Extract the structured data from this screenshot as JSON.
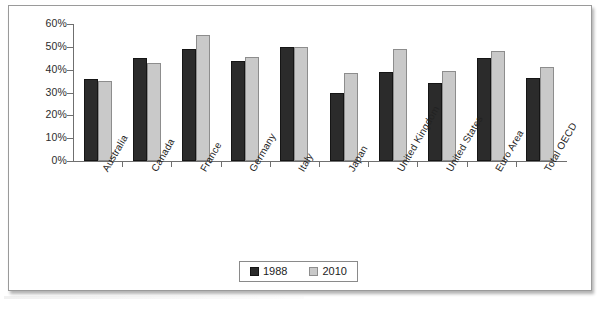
{
  "chart_data": {
    "type": "bar",
    "title": "",
    "xlabel": "",
    "ylabel": "",
    "ylim": [
      0,
      60
    ],
    "ytick_labels": [
      "60%",
      "50%",
      "40%",
      "30%",
      "20%",
      "10%",
      "0%"
    ],
    "ytick_values": [
      60,
      50,
      40,
      30,
      20,
      10,
      0
    ],
    "grid": false,
    "legend_position": "bottom-center",
    "categories": [
      "Australia",
      "Canada",
      "France",
      "Germany",
      "Italy",
      "Japan",
      "United Kingdom",
      "United States",
      "Euro Area",
      "Total OECD"
    ],
    "series": [
      {
        "name": "1988",
        "color": "#2b2b2b",
        "values": [
          36,
          45,
          49,
          44,
          50,
          30,
          39,
          34,
          45,
          36.5
        ]
      },
      {
        "name": "2010",
        "color": "#c9c9c9",
        "values": [
          35,
          43,
          55,
          45.5,
          50,
          38.5,
          49,
          39.5,
          48,
          41
        ]
      }
    ]
  },
  "legend": {
    "items": [
      {
        "label": "1988"
      },
      {
        "label": "2010"
      }
    ]
  }
}
